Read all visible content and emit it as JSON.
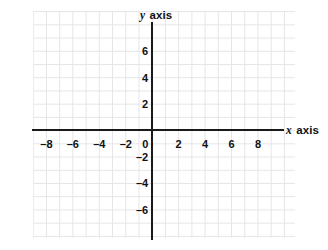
{
  "figure": {
    "kind": "cartesian-coordinate-plane",
    "background_color": "#ffffff",
    "grid_color": "#e6e6ea",
    "axis_color": "#1a1a1a",
    "label_color": "#111111"
  },
  "axes": {
    "x": {
      "name": "x axis",
      "variable": "x",
      "name_suffix": " axis",
      "min": -9,
      "max": 9.8,
      "tick_step": 2
    },
    "y": {
      "name": "y axis",
      "variable": "y",
      "name_suffix": " axis",
      "min": -7.2,
      "max": 8.0,
      "tick_step": 2
    }
  },
  "chart_data": {
    "type": "scatter",
    "title": "",
    "subtitle": "",
    "xlabel": "x axis",
    "ylabel": "y axis",
    "xlim": [
      -9,
      9.8
    ],
    "ylim": [
      -7.2,
      8.0
    ],
    "grid": true,
    "grid_spacing": 1,
    "legend": null,
    "series": [],
    "annotations": [],
    "xticks": [
      -8,
      -6,
      -4,
      -2,
      0,
      2,
      4,
      6,
      8
    ],
    "xticklabels": [
      "–8",
      "–6",
      "–4",
      "–2",
      "0",
      "2",
      "4",
      "6",
      "8"
    ],
    "yticks": [
      6,
      4,
      2,
      -2,
      -4,
      -6
    ],
    "yticklabels": [
      "6",
      "4",
      "2",
      "–2",
      "–4",
      "–6"
    ]
  },
  "x_tick_labels": [
    {
      "value": -8,
      "text": "–8"
    },
    {
      "value": -6,
      "text": "–6"
    },
    {
      "value": -4,
      "text": "–4"
    },
    {
      "value": -2,
      "text": "–2"
    },
    {
      "value": 0,
      "text": "0"
    },
    {
      "value": 2,
      "text": "2"
    },
    {
      "value": 4,
      "text": "4"
    },
    {
      "value": 6,
      "text": "6"
    },
    {
      "value": 8,
      "text": "8"
    }
  ],
  "y_tick_labels": [
    {
      "value": 6,
      "text": "6"
    },
    {
      "value": 4,
      "text": "4"
    },
    {
      "value": 2,
      "text": "2"
    },
    {
      "value": -2,
      "text": "–2"
    },
    {
      "value": -4,
      "text": "–4"
    },
    {
      "value": -6,
      "text": "–6"
    }
  ]
}
